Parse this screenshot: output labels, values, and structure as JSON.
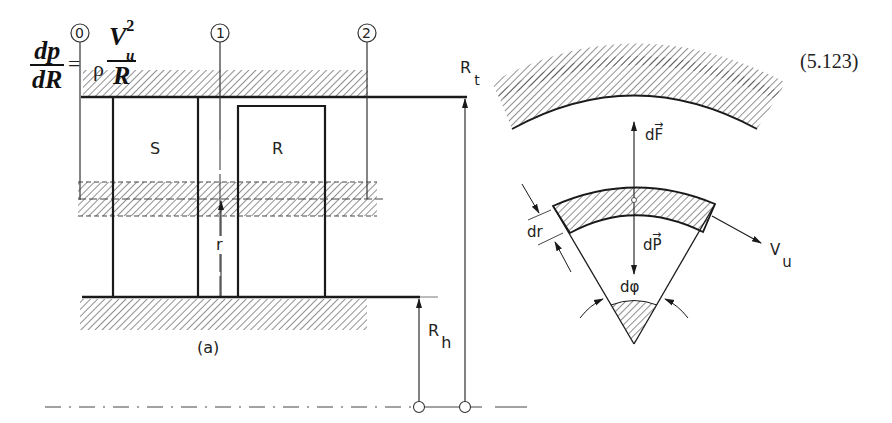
{
  "equation": {
    "lhs_numerator": "dp",
    "lhs_denominator": "dR",
    "equals": "=",
    "rho": "ρ",
    "rhs_numerator": "V",
    "rhs_numerator_subscript": "u",
    "rhs_numerator_superscript": "2",
    "rhs_denominator": "R",
    "number": "(5.123)"
  },
  "figure_a": {
    "caption": "(a)",
    "stations": [
      "0",
      "1",
      "2"
    ],
    "stator_label": "S",
    "rotor_label": "R",
    "radius_label": "r",
    "tip_radius_label": "R",
    "tip_radius_subscript": "t",
    "hub_radius_label": "R",
    "hub_radius_subscript": "h"
  },
  "figure_b": {
    "force_up_label": "dF",
    "force_down_label": "dP",
    "vector_arrow": "→",
    "thickness_label": "dr",
    "angle_label": "dφ",
    "velocity_label": "V",
    "velocity_subscript": "u"
  },
  "colors": {
    "line": "#1a1a1a",
    "hatch": "#333333",
    "background": "#ffffff"
  }
}
